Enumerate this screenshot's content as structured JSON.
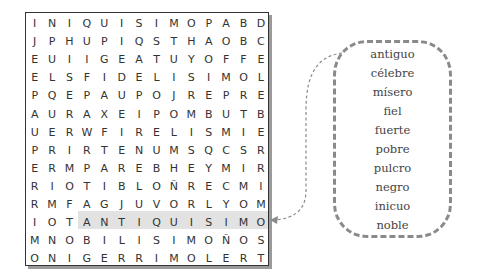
{
  "puzzle": {
    "grid": [
      [
        "I",
        "N",
        "I",
        "Q",
        "U",
        "I",
        "S",
        "I",
        "M",
        "O",
        "P",
        "A",
        "B",
        "D"
      ],
      [
        "J",
        "P",
        "H",
        "U",
        "P",
        "I",
        "Q",
        "S",
        "T",
        "H",
        "A",
        "O",
        "B",
        "C"
      ],
      [
        "E",
        "U",
        "I",
        "I",
        "G",
        "E",
        "A",
        "T",
        "U",
        "Y",
        "O",
        "F",
        "F",
        "E"
      ],
      [
        "E",
        "L",
        "S",
        "F",
        "I",
        "D",
        "E",
        "L",
        "I",
        "S",
        "I",
        "M",
        "O",
        "L"
      ],
      [
        "P",
        "Q",
        "E",
        "P",
        "A",
        "U",
        "P",
        "O",
        "J",
        "R",
        "E",
        "P",
        "R",
        "E"
      ],
      [
        "A",
        "U",
        "R",
        "A",
        "X",
        "E",
        "I",
        "P",
        "O",
        "M",
        "B",
        "U",
        "T",
        "B"
      ],
      [
        "U",
        "E",
        "R",
        "W",
        "F",
        "I",
        "R",
        "E",
        "L",
        "I",
        "S",
        "M",
        "I",
        "E"
      ],
      [
        "P",
        "R",
        "I",
        "R",
        "T",
        "E",
        "N",
        "U",
        "M",
        "S",
        "Q",
        "C",
        "S",
        "R"
      ],
      [
        "E",
        "R",
        "M",
        "P",
        "A",
        "R",
        "E",
        "B",
        "H",
        "E",
        "Y",
        "M",
        "I",
        "R"
      ],
      [
        "R",
        "I",
        "O",
        "T",
        "I",
        "B",
        "L",
        "O",
        "Ñ",
        "R",
        "E",
        "C",
        "M",
        "I"
      ],
      [
        "R",
        "M",
        "F",
        "A",
        "G",
        "J",
        "U",
        "V",
        "O",
        "R",
        "L",
        "Y",
        "O",
        "M"
      ],
      [
        "I",
        "O",
        "T",
        "A",
        "N",
        "T",
        "I",
        "Q",
        "U",
        "I",
        "S",
        "I",
        "M",
        "O"
      ],
      [
        "M",
        "N",
        "O",
        "B",
        "I",
        "L",
        "I",
        "S",
        "I",
        "M",
        "O",
        "Ñ",
        "O",
        "S"
      ],
      [
        "O",
        "N",
        "I",
        "G",
        "E",
        "R",
        "R",
        "I",
        "M",
        "O",
        "L",
        "E",
        "R",
        "T"
      ]
    ],
    "highlight": {
      "row": 11,
      "col_start": 3,
      "col_end": 13,
      "word": "ANTIQUISIMO"
    }
  },
  "word_list": {
    "words": [
      "antiguo",
      "célebre",
      "mísero",
      "fiel",
      "fuerte",
      "pobre",
      "pulcro",
      "negro",
      "inicuo",
      "noble"
    ]
  },
  "colors": {
    "highlight": "#e2e2e2",
    "dashed_border": "#8a8a8a",
    "text": "#333333"
  }
}
